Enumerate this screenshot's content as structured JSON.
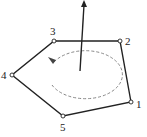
{
  "diagram": {
    "type": "polygon-orientation",
    "stroke_color": "#222222",
    "dashed_color": "#888888",
    "vertices": [
      {
        "id": "1",
        "label": "1",
        "x": 131,
        "y": 102,
        "lx": 136,
        "ly": 108
      },
      {
        "id": "2",
        "label": "2",
        "x": 120,
        "y": 41,
        "lx": 125,
        "ly": 45
      },
      {
        "id": "3",
        "label": "3",
        "x": 54,
        "y": 41,
        "lx": 50,
        "ly": 35
      },
      {
        "id": "4",
        "label": "4",
        "x": 12,
        "y": 75,
        "lx": 1,
        "ly": 79
      },
      {
        "id": "5",
        "label": "5",
        "x": 63,
        "y": 116,
        "lx": 60,
        "ly": 130
      }
    ],
    "normal_arrow": {
      "x1": 80,
      "y1": 71,
      "x2": 84,
      "y2": 2
    },
    "rotation_ellipse": {
      "cx": 86,
      "cy": 77,
      "rx": 37,
      "ry": 24
    }
  }
}
